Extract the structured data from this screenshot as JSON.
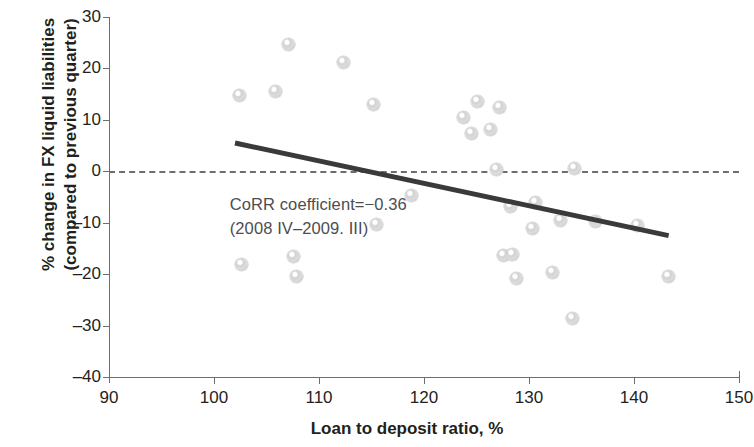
{
  "chart_data": {
    "type": "scatter",
    "title": "",
    "xlabel": "Loan to deposit ratio, %",
    "ylabel": "% change in FX liquid liabilities\n(compared to previous quarter)",
    "xlim": [
      90,
      150
    ],
    "ylim": [
      -40,
      30
    ],
    "xticks": [
      90,
      100,
      110,
      120,
      130,
      140,
      150
    ],
    "yticks": [
      30,
      20,
      10,
      0,
      -10,
      -20,
      -30,
      -40
    ],
    "xtick_labels": [
      "90",
      "100",
      "110",
      "120",
      "130",
      "140",
      "150"
    ],
    "ytick_labels": [
      "30",
      "20",
      "10",
      "0",
      "-10",
      "-20",
      "-30",
      "-40"
    ],
    "grid": false,
    "legend": null,
    "marker_color": "#d7d7d7",
    "trend_color": "#3a3a3c",
    "zero_line_color": "#6d6e70",
    "axis_color": "#6d6e70",
    "text_color": "#231f20",
    "annotation_color": "#4d4d4f",
    "annotation_lines": [
      "CoRR coefficient=−0.36",
      "(2008 IV–2009. III)"
    ],
    "annotation_x": 101.5,
    "annotation_y": -4.2,
    "trend_line": {
      "x0": 102.0,
      "y0": 5.5,
      "x1": 143.3,
      "y1": -12.5,
      "width": 5
    },
    "zero_line": {
      "y": 0,
      "x0": 90,
      "x1": 150
    },
    "points": [
      {
        "x": 102.4,
        "y": 14.8
      },
      {
        "x": 102.6,
        "y": -18.2
      },
      {
        "x": 105.9,
        "y": 15.5
      },
      {
        "x": 107.1,
        "y": 24.6
      },
      {
        "x": 107.6,
        "y": -16.6
      },
      {
        "x": 107.9,
        "y": -20.4
      },
      {
        "x": 112.3,
        "y": 21.2
      },
      {
        "x": 115.2,
        "y": 12.9
      },
      {
        "x": 115.5,
        "y": -10.3
      },
      {
        "x": 118.8,
        "y": -4.7
      },
      {
        "x": 123.8,
        "y": 10.5
      },
      {
        "x": 124.5,
        "y": 7.3
      },
      {
        "x": 125.1,
        "y": 13.6
      },
      {
        "x": 126.3,
        "y": 8.2
      },
      {
        "x": 127.2,
        "y": 12.4
      },
      {
        "x": 126.9,
        "y": 0.4
      },
      {
        "x": 127.6,
        "y": -16.4
      },
      {
        "x": 128.4,
        "y": -16.1
      },
      {
        "x": 128.2,
        "y": -6.8
      },
      {
        "x": 128.8,
        "y": -20.9
      },
      {
        "x": 130.6,
        "y": -6.1
      },
      {
        "x": 130.3,
        "y": -11.2
      },
      {
        "x": 132.2,
        "y": -19.6
      },
      {
        "x": 133.0,
        "y": -9.5
      },
      {
        "x": 134.1,
        "y": -28.7
      },
      {
        "x": 134.3,
        "y": 0.6
      },
      {
        "x": 136.3,
        "y": -9.7
      },
      {
        "x": 140.3,
        "y": -10.6
      },
      {
        "x": 143.3,
        "y": -20.4
      }
    ]
  }
}
